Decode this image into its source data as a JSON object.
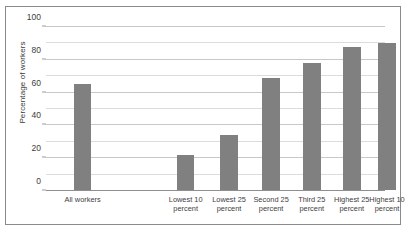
{
  "chart_data": {
    "type": "bar",
    "title": "",
    "xlabel": "",
    "ylabel": "Percentage of workers",
    "categories": [
      "All workers",
      "Lowest 10 percent",
      "Lowest 25 percent",
      "Second 25 percent",
      "Third 25 percent",
      "Highest 25 percent",
      "Highest 10 percent"
    ],
    "category_lines": [
      [
        "All workers"
      ],
      [
        "Lowest 10",
        "percent"
      ],
      [
        "Lowest 25",
        "percent"
      ],
      [
        "Second 25",
        "percent"
      ],
      [
        "Third 25",
        "percent"
      ],
      [
        "Highest 25",
        "percent"
      ],
      [
        "Highest 10",
        "percent"
      ]
    ],
    "values": [
      65,
      22,
      34,
      69,
      78,
      88,
      90
    ],
    "ylim": [
      0,
      100
    ],
    "ytick_labels": [
      "0",
      "20",
      "40",
      "60",
      "80",
      "100"
    ],
    "ytick_values": [
      0,
      20,
      40,
      60,
      80,
      100
    ],
    "gridline_values": [
      0,
      10,
      20,
      30,
      40,
      50,
      60,
      70,
      80,
      90,
      100
    ],
    "grid": true,
    "legend": "none",
    "bar_color": "#808080",
    "grid_color": "#dcdcdc",
    "axis_color": "#8e8e8e",
    "frame_color": "#8a8a8a",
    "background": "#ffffff",
    "bar_centers_pct": [
      10.8,
      41.2,
      54.0,
      66.4,
      78.4,
      90.2,
      100.6
    ],
    "bar_width_pct": 5.2
  }
}
